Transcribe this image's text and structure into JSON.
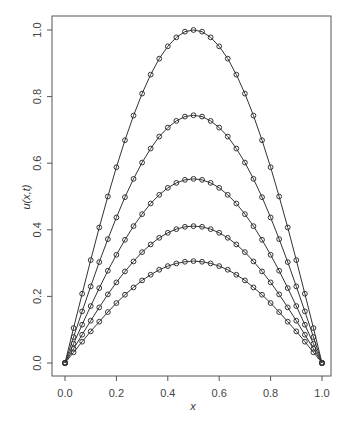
{
  "chart_data": {
    "type": "line",
    "title": "",
    "xlabel": "x",
    "ylabel": "u(x,t)",
    "xlim": [
      0,
      1
    ],
    "ylim": [
      0,
      1
    ],
    "grid": false,
    "legend": null,
    "marker": "open-circle",
    "x_ticks": [
      "0.0",
      "0.2",
      "0.4",
      "0.6",
      "0.8",
      "1.0"
    ],
    "y_ticks": [
      "0.0",
      "0.2",
      "0.4",
      "0.6",
      "0.8",
      "1.0"
    ],
    "x": [
      0,
      0.0333,
      0.0667,
      0.1,
      0.1333,
      0.1667,
      0.2,
      0.2333,
      0.2667,
      0.3,
      0.3333,
      0.3667,
      0.4,
      0.4333,
      0.4667,
      0.5,
      0.5333,
      0.5667,
      0.6,
      0.6333,
      0.6667,
      0.7,
      0.7333,
      0.7667,
      0.8,
      0.8333,
      0.8667,
      0.9,
      0.9333,
      0.9667,
      1.0
    ],
    "series": [
      {
        "name": "t0",
        "amplitude": 1.0,
        "values": [
          0,
          0.105,
          0.208,
          0.309,
          0.407,
          0.5,
          0.588,
          0.669,
          0.743,
          0.809,
          0.866,
          0.914,
          0.951,
          0.978,
          0.995,
          1.0,
          0.995,
          0.978,
          0.951,
          0.914,
          0.866,
          0.809,
          0.743,
          0.669,
          0.588,
          0.5,
          0.407,
          0.309,
          0.208,
          0.105,
          0
        ]
      },
      {
        "name": "t1",
        "amplitude": 0.744,
        "values": [
          0,
          0.078,
          0.155,
          0.23,
          0.303,
          0.372,
          0.437,
          0.498,
          0.553,
          0.602,
          0.644,
          0.68,
          0.707,
          0.727,
          0.74,
          0.744,
          0.74,
          0.727,
          0.707,
          0.68,
          0.644,
          0.602,
          0.553,
          0.498,
          0.437,
          0.372,
          0.303,
          0.23,
          0.155,
          0.078,
          0
        ]
      },
      {
        "name": "t2",
        "amplitude": 0.553,
        "values": [
          0,
          0.058,
          0.115,
          0.171,
          0.225,
          0.277,
          0.325,
          0.37,
          0.411,
          0.447,
          0.479,
          0.505,
          0.526,
          0.541,
          0.55,
          0.553,
          0.55,
          0.541,
          0.526,
          0.505,
          0.479,
          0.447,
          0.411,
          0.37,
          0.325,
          0.277,
          0.225,
          0.171,
          0.115,
          0.058,
          0
        ]
      },
      {
        "name": "t3",
        "amplitude": 0.411,
        "values": [
          0,
          0.043,
          0.085,
          0.127,
          0.167,
          0.206,
          0.242,
          0.275,
          0.305,
          0.333,
          0.356,
          0.376,
          0.391,
          0.402,
          0.409,
          0.411,
          0.409,
          0.402,
          0.391,
          0.376,
          0.356,
          0.333,
          0.305,
          0.275,
          0.242,
          0.206,
          0.167,
          0.127,
          0.085,
          0.043,
          0
        ]
      },
      {
        "name": "t4",
        "amplitude": 0.306,
        "values": [
          0,
          0.032,
          0.064,
          0.095,
          0.124,
          0.153,
          0.18,
          0.205,
          0.227,
          0.248,
          0.265,
          0.28,
          0.291,
          0.299,
          0.304,
          0.306,
          0.304,
          0.299,
          0.291,
          0.28,
          0.265,
          0.248,
          0.227,
          0.205,
          0.18,
          0.153,
          0.124,
          0.095,
          0.064,
          0.032,
          0
        ]
      }
    ]
  },
  "style": {
    "line_color": "#333333",
    "axis_color": "#555555",
    "text_color": "#444444",
    "background": "#ffffff"
  }
}
